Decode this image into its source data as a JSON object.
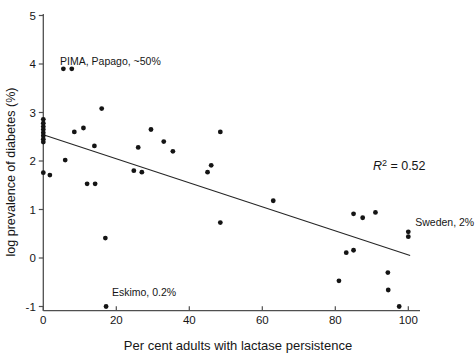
{
  "figure": {
    "background": "#ffffff"
  },
  "chart_data": {
    "type": "scatter",
    "title": "",
    "xlabel": "Per cent adults with lactase persistence",
    "ylabel": "log prevalence of diabetes (%)",
    "xlim": [
      0,
      105
    ],
    "ylim": [
      -1,
      5
    ],
    "x_ticks": [
      0,
      20,
      40,
      60,
      80,
      100
    ],
    "y_ticks": [
      5,
      4,
      3,
      2,
      1,
      0,
      -1
    ],
    "grid": false,
    "legend": false,
    "axis_color": "#4f4f4f",
    "text_color": "#161616",
    "marker": {
      "shape": "circle",
      "color": "#141414",
      "radius_px": 2.4
    },
    "points": [
      [
        0,
        2.86
      ],
      [
        0,
        2.78
      ],
      [
        0,
        2.71
      ],
      [
        0,
        2.65
      ],
      [
        0,
        2.58
      ],
      [
        0,
        2.52
      ],
      [
        0,
        2.45
      ],
      [
        0,
        2.39
      ],
      [
        0,
        1.76
      ],
      [
        1.8,
        1.71
      ],
      [
        5.5,
        3.9
      ],
      [
        7.8,
        3.9
      ],
      [
        6,
        2.02
      ],
      [
        8.5,
        2.6
      ],
      [
        11,
        2.68
      ],
      [
        12,
        1.53
      ],
      [
        14.2,
        1.53
      ],
      [
        14,
        2.31
      ],
      [
        16,
        3.08
      ],
      [
        17,
        0.41
      ],
      [
        17.2,
        -1.0
      ],
      [
        24.8,
        1.8
      ],
      [
        27,
        1.77
      ],
      [
        26,
        2.28
      ],
      [
        29.5,
        2.65
      ],
      [
        33,
        2.4
      ],
      [
        35.5,
        2.2
      ],
      [
        45,
        1.77
      ],
      [
        46,
        1.91
      ],
      [
        48.5,
        2.6
      ],
      [
        48.5,
        0.73
      ],
      [
        63,
        1.18
      ],
      [
        81,
        -0.47
      ],
      [
        83,
        0.11
      ],
      [
        85,
        0.16
      ],
      [
        85,
        0.91
      ],
      [
        87.5,
        0.83
      ],
      [
        91,
        0.94
      ],
      [
        94.4,
        -0.3
      ],
      [
        94.5,
        -0.66
      ],
      [
        97.5,
        -1.0
      ],
      [
        100,
        0.54
      ],
      [
        100,
        0.44
      ]
    ],
    "trend_line": {
      "x1": 0,
      "y1": 2.54,
      "x2": 100.5,
      "y2": 0.05
    },
    "r_squared": 0.52,
    "annotations": {
      "pima": {
        "text": "PIMA, Papago, ~50%",
        "x": 4.6,
        "y": 4.07
      },
      "eskimo": {
        "text": "Eskimo, 0.2%",
        "x": 18.8,
        "y": -0.71
      },
      "sweden": {
        "text": "Sweden, 2%",
        "x": 101.9,
        "y": 0.74
      },
      "r_squared_label": {
        "var": "R",
        "sup": "2",
        "rest": " = 0.52",
        "x": 90.3,
        "y": 1.89
      }
    }
  }
}
